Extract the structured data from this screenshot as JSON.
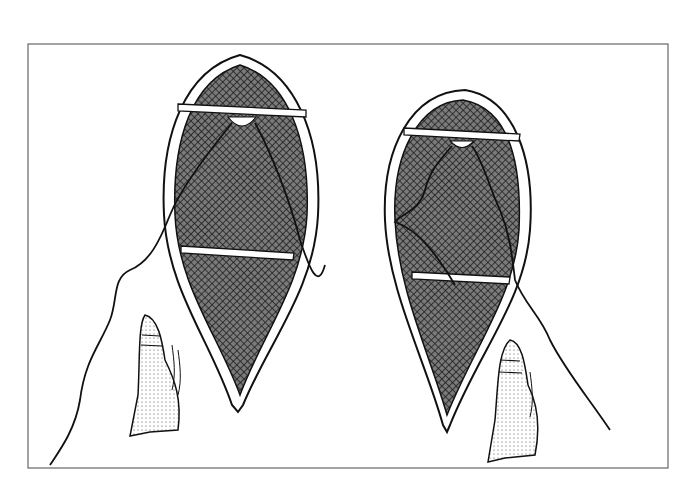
{
  "figure": {
    "colors": {
      "ink": "#1a1a1a",
      "mesh": "#555555",
      "background": "#ffffff",
      "frame": "#666666"
    },
    "items": [
      {
        "name": "left-snowshoe",
        "has_moccasin": true
      },
      {
        "name": "right-snowshoe",
        "has_moccasin": true
      }
    ]
  }
}
